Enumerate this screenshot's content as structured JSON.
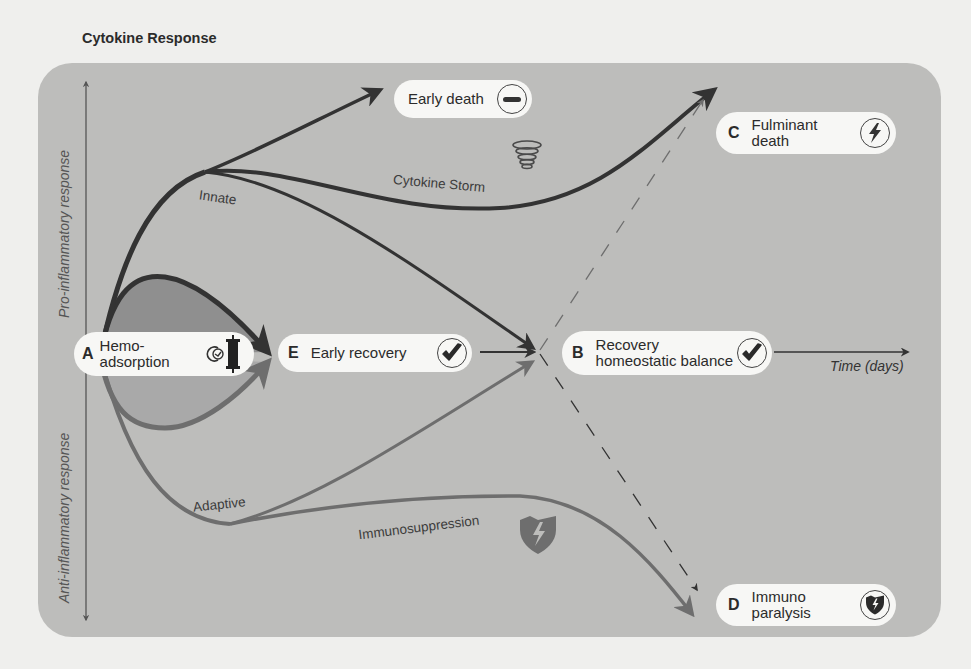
{
  "title": "Cytokine Response",
  "axes": {
    "y_up": "Pro-inflammatory response",
    "y_down": "Anti-inflammatory response",
    "x": "Time (days)"
  },
  "nodes": {
    "A": {
      "letter": "A",
      "text_line1": "Hemo-",
      "text_line2": "adsorption",
      "icon": "hemoadsorption-cartridge-icon"
    },
    "E": {
      "letter": "E",
      "text": "Early recovery",
      "icon": "checkmark-icon"
    },
    "B": {
      "letter": "B",
      "text_line1": "Recovery",
      "text_line2": "homeostatic balance",
      "icon": "checkmark-icon"
    },
    "C": {
      "letter": "C",
      "text_line1": "Fulminant",
      "text_line2": "death",
      "icon": "lightning-icon"
    },
    "D": {
      "letter": "D",
      "text_line1": "Immuno",
      "text_line2": "paralysis",
      "icon": "shield-lightning-icon"
    },
    "early_death": {
      "text": "Early death",
      "icon": "minus-icon"
    }
  },
  "curve_labels": {
    "innate": "Innate",
    "cytokine_storm": "Cytokine Storm",
    "adaptive": "Adaptive",
    "immunosuppression": "Immunosuppression"
  },
  "colors": {
    "panel": "#bdbdbb",
    "pro_curve": "#3a3a3a",
    "anti_curve": "#6e6e6e",
    "pro_fill": "#8f8f8f",
    "anti_fill": "#a9a9a9",
    "pill": "#f7f7f5"
  }
}
